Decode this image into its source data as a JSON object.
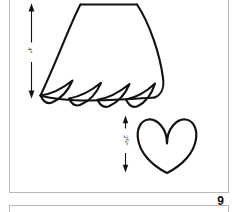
{
  "document": {
    "type": "sewing-pattern-diagram",
    "page_number": "9",
    "background_color": "#ffffff",
    "ink_color": "#111111",
    "rule_color": "#b9b9b9"
  },
  "panels": [
    {
      "name": "main-figure-panel",
      "label": ""
    },
    {
      "name": "next-figure-panel",
      "label": ""
    }
  ],
  "figures": [
    {
      "name": "fringed-skirt-shape",
      "description": "tapered skirt piece with four pointed scallop fringes along lower edge",
      "dimension": {
        "name": "skirt-height-dimension",
        "value": "4",
        "unit": "\"",
        "fraction": "",
        "orientation": "vertical",
        "display": "4\""
      }
    },
    {
      "name": "heart-shape",
      "description": "outlined heart motif",
      "dimension": {
        "name": "heart-height-dimension",
        "value": "2",
        "unit": "\"",
        "fraction": "1/4",
        "orientation": "vertical",
        "display": "2¼\""
      }
    }
  ],
  "labels": {
    "skirt_dimension": "4″",
    "heart_dimension_whole": "2",
    "heart_dimension_fraction": "¼",
    "heart_dimension_unit": "″",
    "page_number": "9"
  }
}
